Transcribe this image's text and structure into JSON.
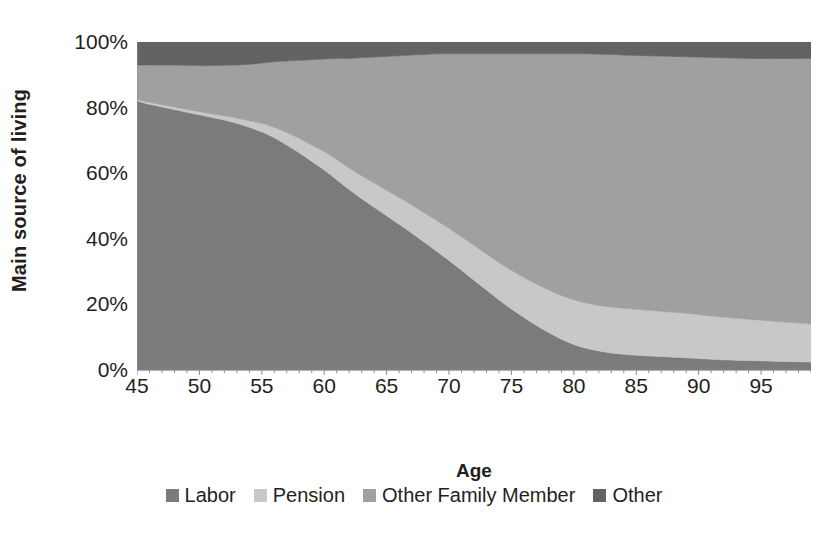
{
  "chart_data": {
    "type": "area",
    "stacked": true,
    "normalized": true,
    "title": "",
    "xlabel": "Age",
    "ylabel": "Main source of living",
    "xlim": [
      45,
      99
    ],
    "ylim": [
      0,
      100
    ],
    "grid": false,
    "legend_position": "bottom",
    "x_tick_labels": [
      "45",
      "50",
      "55",
      "60",
      "65",
      "70",
      "75",
      "80",
      "85",
      "90",
      "95"
    ],
    "x_ticks": [
      45,
      50,
      55,
      60,
      65,
      70,
      75,
      80,
      85,
      90,
      95
    ],
    "y_tick_labels": [
      "0%",
      "20%",
      "40%",
      "60%",
      "80%",
      "100%"
    ],
    "y_ticks": [
      0,
      20,
      40,
      60,
      80,
      100
    ],
    "x": [
      45,
      46,
      47,
      48,
      49,
      50,
      51,
      52,
      53,
      54,
      55,
      56,
      57,
      58,
      59,
      60,
      61,
      62,
      63,
      64,
      65,
      66,
      67,
      68,
      69,
      70,
      71,
      72,
      73,
      74,
      75,
      76,
      77,
      78,
      79,
      80,
      81,
      82,
      83,
      84,
      85,
      86,
      87,
      88,
      89,
      90,
      91,
      92,
      93,
      94,
      95,
      96,
      97,
      98,
      99
    ],
    "series": [
      {
        "name": "Labor",
        "color": "#7b7b7b",
        "values": [
          82.0,
          81.0,
          80.2,
          79.4,
          78.6,
          77.8,
          77.0,
          76.2,
          75.2,
          74.0,
          72.6,
          70.8,
          68.6,
          66.2,
          63.6,
          61.0,
          58.0,
          55.0,
          52.2,
          49.6,
          47.0,
          44.4,
          41.8,
          39.0,
          36.2,
          33.4,
          30.4,
          27.4,
          24.4,
          21.4,
          18.6,
          16.0,
          13.6,
          11.4,
          9.4,
          7.8,
          6.6,
          5.8,
          5.2,
          4.8,
          4.5,
          4.3,
          4.1,
          3.9,
          3.7,
          3.5,
          3.3,
          3.1,
          3.0,
          2.9,
          2.8,
          2.7,
          2.6,
          2.5,
          2.4
        ]
      },
      {
        "name": "Pension",
        "color": "#c8c8c8",
        "values": [
          0.5,
          0.6,
          0.7,
          0.8,
          0.9,
          1.0,
          1.1,
          1.3,
          1.6,
          2.0,
          2.6,
          3.2,
          3.8,
          4.4,
          5.0,
          5.6,
          6.2,
          6.6,
          7.0,
          7.4,
          7.8,
          8.2,
          8.6,
          9.0,
          9.4,
          9.8,
          10.2,
          10.6,
          11.0,
          11.4,
          11.8,
          12.2,
          12.6,
          13.0,
          13.3,
          13.6,
          13.8,
          13.9,
          14.0,
          14.0,
          14.0,
          13.9,
          13.8,
          13.7,
          13.6,
          13.4,
          13.2,
          13.0,
          12.8,
          12.6,
          12.4,
          12.2,
          12.0,
          11.8,
          11.6
        ]
      },
      {
        "name": "Other Family Member",
        "color": "#a0a0a0",
        "values": [
          10.5,
          11.4,
          12.1,
          12.8,
          13.4,
          14.0,
          14.7,
          15.4,
          16.2,
          17.2,
          18.4,
          20.0,
          21.8,
          23.8,
          26.0,
          28.2,
          30.8,
          33.4,
          36.0,
          38.4,
          40.8,
          43.2,
          45.6,
          48.2,
          50.8,
          53.2,
          55.8,
          58.4,
          61.0,
          63.6,
          66.0,
          68.2,
          70.2,
          72.0,
          73.7,
          75.0,
          76.0,
          76.6,
          77.0,
          77.2,
          77.4,
          77.6,
          77.8,
          78.0,
          78.2,
          78.5,
          78.8,
          79.1,
          79.3,
          79.5,
          79.8,
          80.1,
          80.4,
          80.7,
          81.0
        ]
      },
      {
        "name": "Other",
        "color": "#636363",
        "values": [
          7.0,
          7.0,
          7.0,
          7.0,
          7.1,
          7.2,
          7.2,
          7.1,
          7.0,
          6.8,
          6.4,
          6.0,
          5.8,
          5.6,
          5.4,
          5.2,
          5.0,
          5.0,
          4.8,
          4.6,
          4.4,
          4.2,
          4.0,
          3.8,
          3.6,
          3.6,
          3.6,
          3.6,
          3.6,
          3.6,
          3.6,
          3.6,
          3.6,
          3.6,
          3.6,
          3.6,
          3.6,
          3.7,
          3.8,
          4.0,
          4.1,
          4.2,
          4.3,
          4.4,
          4.5,
          4.6,
          4.7,
          4.8,
          4.9,
          5.0,
          5.0,
          5.0,
          5.0,
          5.0,
          5.0
        ]
      }
    ],
    "legend": [
      {
        "label": "Labor",
        "color": "#7b7b7b"
      },
      {
        "label": "Pension",
        "color": "#c8c8c8"
      },
      {
        "label": "Other Family Member",
        "color": "#a0a0a0"
      },
      {
        "label": "Other",
        "color": "#636363"
      }
    ],
    "axis_color": "#8c8c8c",
    "background": "#ffffff",
    "text_color": "#231f20"
  }
}
